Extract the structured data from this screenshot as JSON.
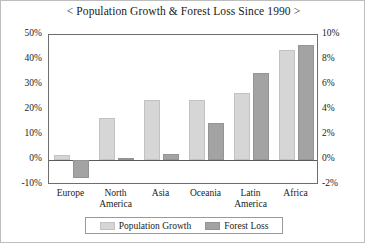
{
  "chart_data": {
    "type": "bar",
    "title": "< Population Growth & Forest Loss Since 1990 >",
    "xlabel": "",
    "ylabel": "",
    "grid": false,
    "legend_position": "bottom",
    "categories": [
      "Europe",
      "North\nAmerica",
      "Asia",
      "Oceania",
      "Latin\nAmerica",
      "Africa"
    ],
    "left_axis": {
      "label": "Population Growth",
      "ticks": [
        "50%",
        "40%",
        "30%",
        "20%",
        "10%",
        "0%",
        "-10%"
      ],
      "tick_values": [
        50,
        40,
        30,
        20,
        10,
        0,
        -10
      ],
      "ylim": [
        -10,
        50
      ]
    },
    "right_axis": {
      "label": "Forest Loss",
      "ticks": [
        "10%",
        "8%",
        "6%",
        "4%",
        "2%",
        "0%",
        "-2%"
      ],
      "tick_values": [
        10,
        8,
        6,
        4,
        2,
        0,
        -2
      ],
      "ylim": [
        -2,
        10
      ]
    },
    "series": [
      {
        "name": "Population Growth",
        "axis": "left",
        "color": "#d6d6d6",
        "values": [
          2,
          17,
          24,
          24,
          27,
          44
        ]
      },
      {
        "name": "Forest Loss",
        "axis": "right",
        "color": "#a3a3a3",
        "values": [
          -1.4,
          0.2,
          0.5,
          3.0,
          7.0,
          9.2
        ]
      }
    ]
  },
  "legend": {
    "items": [
      {
        "label": "Population Growth",
        "swatch": "light-gray-swatch"
      },
      {
        "label": "Forest Loss",
        "swatch": "dark-gray-swatch"
      }
    ]
  }
}
